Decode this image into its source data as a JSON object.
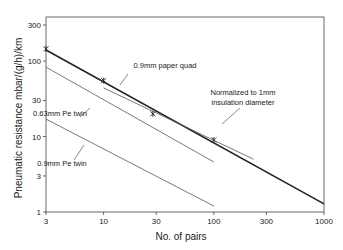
{
  "chart_data": {
    "type": "line",
    "title": "",
    "xlabel": "No. of pairs",
    "ylabel": "Pneumatic resistance  mbar/(g/h)/km",
    "xscale": "log",
    "yscale": "log",
    "xlim": [
      3,
      1000
    ],
    "ylim": [
      1,
      400
    ],
    "xticks": [
      3,
      10,
      30,
      100,
      300,
      1000
    ],
    "xtick_labels": [
      "3",
      "10",
      "30",
      "100",
      "300",
      "1000"
    ],
    "yticks": [
      1,
      3,
      10,
      30,
      100,
      300
    ],
    "ytick_labels": [
      "1",
      "3",
      "10",
      "30",
      "100",
      "300"
    ],
    "grid": false,
    "series": [
      {
        "name": "Normalized to 1mm insulation diameter",
        "style": "thick",
        "x": [
          3,
          1000
        ],
        "y": [
          140,
          1.28
        ],
        "markers": {
          "x": [
            3,
            10,
            28,
            100
          ],
          "y": [
            145,
            55,
            20,
            9
          ]
        }
      },
      {
        "name": "0.9mm paper quad",
        "style": "thin",
        "x": [
          10,
          230
        ],
        "y": [
          44,
          5
        ]
      },
      {
        "name": "0.63mm Pe twin",
        "style": "thin",
        "x": [
          3,
          100
        ],
        "y": [
          83,
          4.6
        ]
      },
      {
        "name": "0.9mm Pe twin",
        "style": "thin",
        "x": [
          3,
          100
        ],
        "y": [
          17,
          1.2
        ]
      }
    ],
    "annotations": [
      {
        "text": "0.9mm paper quad",
        "x": 165,
        "y": 68
      },
      {
        "text": "Normalized to 1mm",
        "x": 243,
        "y": 95
      },
      {
        "text": "insulation diameter",
        "x": 243,
        "y": 105
      },
      {
        "text": "0.63mm Pe twin",
        "x": 60,
        "y": 116
      },
      {
        "text": "0.9mm Pe twin",
        "x": 62,
        "y": 166
      }
    ]
  }
}
